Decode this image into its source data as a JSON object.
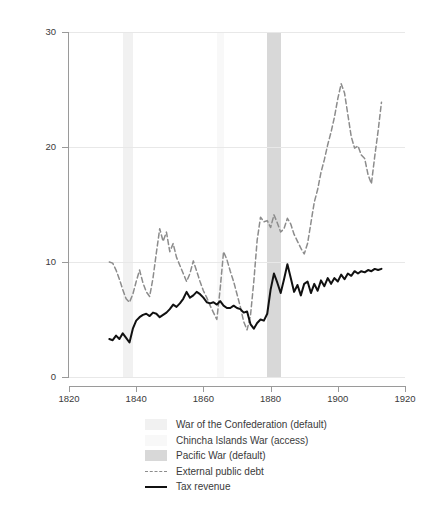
{
  "chart_data": {
    "type": "line",
    "title": "",
    "xlabel": "",
    "ylabel": "% of GDP",
    "xlim": [
      1820,
      1920
    ],
    "ylim": [
      0,
      30
    ],
    "xticks": [
      1820,
      1840,
      1860,
      1880,
      1900,
      1920
    ],
    "yticks": [
      0,
      10,
      20,
      30
    ],
    "grid": "horizontal",
    "legend_position": "below-axes",
    "series": [
      {
        "name": "External public debt",
        "style": "dashed",
        "color": "#8c8c8c",
        "x": [
          1832,
          1833,
          1834,
          1835,
          1836,
          1837,
          1838,
          1839,
          1840,
          1841,
          1842,
          1843,
          1844,
          1845,
          1846,
          1847,
          1848,
          1849,
          1850,
          1851,
          1852,
          1853,
          1854,
          1855,
          1856,
          1857,
          1858,
          1859,
          1860,
          1861,
          1862,
          1863,
          1864,
          1865,
          1866,
          1867,
          1868,
          1869,
          1870,
          1871,
          1872,
          1873,
          1874,
          1875,
          1876,
          1877,
          1878,
          1879,
          1880,
          1881,
          1882,
          1883,
          1884,
          1885,
          1886,
          1887,
          1888,
          1889,
          1890,
          1891,
          1892,
          1893,
          1894,
          1895,
          1896,
          1897,
          1898,
          1899,
          1900,
          1901,
          1902,
          1903,
          1904,
          1905,
          1906,
          1907,
          1908,
          1909,
          1910,
          1911,
          1912,
          1913
        ],
        "values": [
          10.0,
          9.9,
          9.3,
          8.5,
          7.6,
          6.8,
          6.5,
          7.2,
          8.3,
          9.3,
          8.2,
          7.4,
          7.0,
          8.6,
          10.8,
          12.9,
          11.8,
          12.6,
          10.9,
          11.6,
          10.4,
          9.7,
          9.0,
          8.3,
          9.0,
          10.1,
          9.2,
          8.3,
          7.5,
          6.9,
          6.2,
          5.6,
          5.0,
          7.7,
          10.9,
          10.2,
          9.2,
          8.3,
          7.2,
          6.1,
          4.8,
          4.1,
          5.3,
          8.3,
          11.9,
          13.9,
          13.5,
          13.6,
          13.0,
          14.1,
          13.4,
          12.6,
          12.9,
          13.8,
          13.3,
          12.4,
          11.8,
          11.2,
          10.7,
          11.6,
          13.4,
          15.2,
          16.3,
          17.8,
          18.9,
          20.2,
          21.3,
          22.6,
          24.2,
          25.5,
          24.7,
          22.8,
          20.9,
          19.9,
          20.1,
          19.3,
          19.0,
          17.6,
          16.8,
          19.2,
          21.4,
          23.9
        ]
      },
      {
        "name": "Tax revenue",
        "style": "solid",
        "color": "#111111",
        "x": [
          1832,
          1833,
          1834,
          1835,
          1836,
          1837,
          1838,
          1839,
          1840,
          1841,
          1842,
          1843,
          1844,
          1845,
          1846,
          1847,
          1848,
          1849,
          1850,
          1851,
          1852,
          1853,
          1854,
          1855,
          1856,
          1857,
          1858,
          1859,
          1860,
          1861,
          1862,
          1863,
          1864,
          1865,
          1866,
          1867,
          1868,
          1869,
          1870,
          1871,
          1872,
          1873,
          1874,
          1875,
          1876,
          1877,
          1878,
          1879,
          1880,
          1881,
          1882,
          1883,
          1884,
          1885,
          1886,
          1887,
          1888,
          1889,
          1890,
          1891,
          1892,
          1893,
          1894,
          1895,
          1896,
          1897,
          1898,
          1899,
          1900,
          1901,
          1902,
          1903,
          1904,
          1905,
          1906,
          1907,
          1908,
          1909,
          1910,
          1911,
          1912,
          1913
        ],
        "values": [
          3.3,
          3.2,
          3.6,
          3.3,
          3.8,
          3.4,
          3.0,
          4.2,
          4.9,
          5.2,
          5.4,
          5.5,
          5.3,
          5.6,
          5.5,
          5.2,
          5.4,
          5.6,
          5.9,
          6.3,
          6.1,
          6.4,
          6.8,
          7.4,
          6.9,
          7.1,
          7.4,
          7.2,
          6.9,
          6.5,
          6.4,
          6.5,
          6.3,
          6.6,
          6.2,
          6.0,
          6.0,
          6.2,
          6.0,
          5.9,
          5.6,
          5.7,
          4.6,
          4.2,
          4.7,
          5.0,
          4.9,
          5.5,
          7.6,
          9.0,
          8.2,
          7.3,
          8.5,
          9.8,
          8.6,
          7.4,
          8.0,
          7.1,
          8.1,
          8.3,
          7.3,
          8.1,
          7.5,
          8.4,
          7.9,
          8.6,
          8.1,
          8.6,
          8.3,
          8.9,
          8.5,
          9.0,
          8.8,
          9.2,
          9.0,
          9.2,
          9.1,
          9.3,
          9.2,
          9.4,
          9.3,
          9.4
        ]
      }
    ],
    "bands": [
      {
        "name": "War of the Confederation (default)",
        "start": 1836,
        "end": 1839,
        "color": "#f1f1f1"
      },
      {
        "name": "Chincha Islands War (access)",
        "start": 1864,
        "end": 1866,
        "color": "#f8f8f8"
      },
      {
        "name": "Pacific War (default)",
        "start": 1879,
        "end": 1883,
        "color": "#d8d8d8"
      }
    ]
  },
  "axes": {
    "y_title": "% of GDP",
    "y_tick_labels": [
      "0",
      "10",
      "20",
      "30"
    ],
    "x_tick_labels": [
      "1820",
      "1840",
      "1860",
      "1880",
      "1900",
      "1920"
    ]
  },
  "legend": {
    "items": [
      {
        "label": "War of the Confederation (default)",
        "kind": "swatch",
        "color": "#f1f1f1"
      },
      {
        "label": "Chincha Islands War (access)",
        "kind": "swatch",
        "color": "#f8f8f8"
      },
      {
        "label": "Pacific War (default)",
        "kind": "swatch",
        "color": "#d8d8d8"
      },
      {
        "label": "External public debt",
        "kind": "dashed-line",
        "color": "#8c8c8c"
      },
      {
        "label": "Tax revenue",
        "kind": "solid-line",
        "color": "#111111"
      }
    ]
  }
}
